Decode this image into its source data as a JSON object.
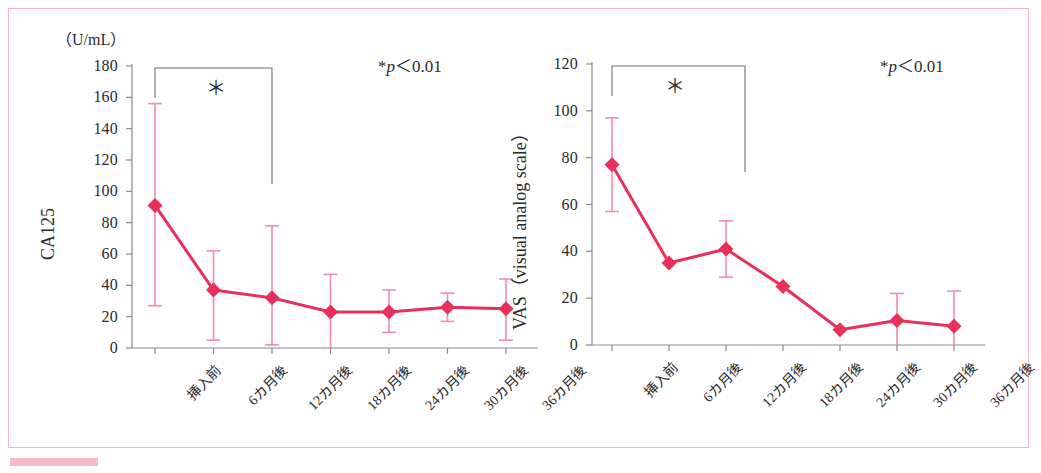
{
  "figure": {
    "accent_color": "#e8305a",
    "error_bar_color": "#f08fa5",
    "frame_color": "#f2b8c0",
    "axis_color": "#8b8b8b",
    "panels": [
      "ca125",
      "vas"
    ]
  },
  "chart_data": [
    {
      "id": "ca125",
      "type": "line",
      "title": "",
      "unit_label": "（U/mL）",
      "ylabel": "CA125",
      "xlabel": "",
      "ylim": [
        0,
        180
      ],
      "yticks": [
        0,
        20,
        40,
        60,
        80,
        100,
        120,
        140,
        160,
        180
      ],
      "ytick_labels": [
        "0",
        "20",
        "40",
        "60",
        "80",
        "100",
        "120",
        "140",
        "160",
        "180"
      ],
      "categories": [
        "挿入前",
        "6カ月後",
        "12カ月後",
        "18カ月後",
        "24カ月後",
        "30カ月後",
        "36カ月後"
      ],
      "values": [
        91,
        37,
        32,
        23,
        23,
        26,
        25
      ],
      "error_upper": [
        156,
        62,
        78,
        47,
        37,
        35,
        44
      ],
      "error_lower": [
        27,
        5,
        2,
        0,
        10,
        17,
        5
      ],
      "grid": false,
      "legend": null,
      "annotations": [
        {
          "name": "significance-bracket",
          "from": "挿入前",
          "to": "12カ月後",
          "symbol": "＊"
        },
        {
          "name": "p-value-note",
          "text": "*p＜0.01",
          "prefix": "*",
          "italic": "p",
          "suffix": "＜0.01"
        }
      ]
    },
    {
      "id": "vas",
      "type": "line",
      "title": "",
      "unit_label": "",
      "ylabel": "VAS（visual analog scale）",
      "xlabel": "",
      "ylim": [
        0,
        120
      ],
      "yticks": [
        0,
        20,
        40,
        60,
        80,
        100,
        120
      ],
      "ytick_labels": [
        "0",
        "20",
        "40",
        "60",
        "80",
        "100",
        "120"
      ],
      "categories": [
        "挿入前",
        "6カ月後",
        "12カ月後",
        "18カ月後",
        "24カ月後",
        "30カ月後",
        "36カ月後"
      ],
      "values": [
        77,
        35,
        41,
        25,
        6.5,
        10.5,
        8
      ],
      "error_upper": [
        97,
        35,
        53,
        25,
        6.5,
        22,
        23
      ],
      "error_lower": [
        57,
        35,
        29,
        25,
        6.5,
        0,
        0
      ],
      "grid": false,
      "legend": null,
      "annotations": [
        {
          "name": "significance-bracket",
          "from": "挿入前",
          "to": "12カ月後",
          "symbol": "＊"
        },
        {
          "name": "p-value-note",
          "text": "*p＜0.01",
          "prefix": "*",
          "italic": "p",
          "suffix": "＜0.01"
        }
      ]
    }
  ]
}
